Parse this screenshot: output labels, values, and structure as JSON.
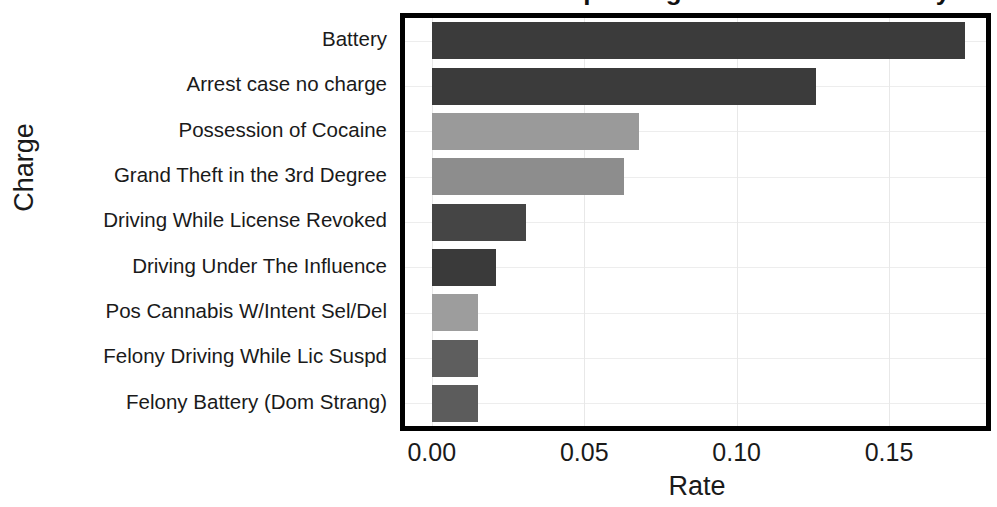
{
  "chart_data": {
    "type": "bar",
    "orientation": "horizontal",
    "title": "Rates of Top Charges in Broward County",
    "xlabel": "Rate",
    "ylabel": "Charge",
    "categories": [
      "Battery",
      "Arrest case no charge",
      "Possession of Cocaine",
      "Grand Theft in the 3rd Degree",
      "Driving While License Revoked",
      "Driving Under The Influence",
      "Pos Cannabis W/Intent Sel/Del",
      "Felony Driving While Lic Suspd",
      "Felony Battery (Dom Strang)"
    ],
    "values": [
      0.175,
      0.126,
      0.068,
      0.063,
      0.031,
      0.021,
      0.015,
      0.015,
      0.015
    ],
    "bar_colors": [
      "#3b3b3b",
      "#3b3b3b",
      "#9a9a9a",
      "#8d8d8d",
      "#454545",
      "#3a3a3a",
      "#9d9d9d",
      "#5e5e5e",
      "#5c5c5c"
    ],
    "xlim": [
      -0.0088,
      0.1818
    ],
    "xticks": [
      0.0,
      0.05,
      0.1,
      0.15
    ],
    "xtick_labels": [
      "0.00",
      "0.05",
      "0.10",
      "0.15"
    ],
    "grid": "both",
    "legend": "none",
    "frame_color": "#000000"
  }
}
